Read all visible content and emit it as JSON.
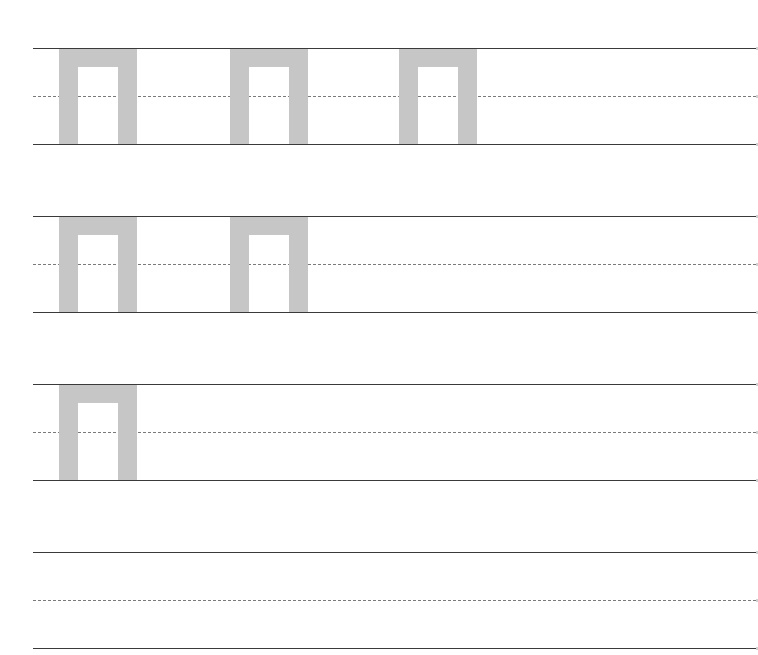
{
  "worksheet": {
    "type": "handwriting-practice",
    "character": "п",
    "glyph_color": "#c6c6c6",
    "line_color": "#3a3a3a",
    "guide_color": "#7a7a7a",
    "rows": [
      {
        "top": 48,
        "glyphs": [
          {
            "char": "п",
            "x": 26
          },
          {
            "char": "п",
            "x": 197
          },
          {
            "char": "п",
            "x": 366
          }
        ]
      },
      {
        "top": 216,
        "glyphs": [
          {
            "char": "п",
            "x": 26
          },
          {
            "char": "п",
            "x": 197
          }
        ]
      },
      {
        "top": 384,
        "glyphs": [
          {
            "char": "п",
            "x": 26
          }
        ]
      },
      {
        "top": 552,
        "glyphs": []
      }
    ]
  }
}
